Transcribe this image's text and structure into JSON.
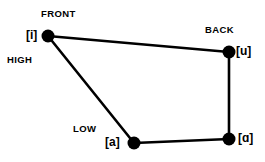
{
  "diagram": {
    "background_color": "#ffffff",
    "stroke_color": "#000000",
    "axis_labels": {
      "front": "FRONT",
      "back": "BACK",
      "high": "HIGH",
      "low": "LOW"
    },
    "vertices": [
      {
        "key": "i",
        "label": "[i]",
        "x": 48,
        "y": 36,
        "dot_radius": 6.5,
        "label_side": "left"
      },
      {
        "key": "u",
        "label": "[u]",
        "x": 229,
        "y": 52,
        "dot_radius": 6.5,
        "label_side": "right"
      },
      {
        "key": "script_a",
        "label": "[ɑ]",
        "x": 229,
        "y": 139,
        "dot_radius": 6.5,
        "label_side": "right"
      },
      {
        "key": "a",
        "label": "[a]",
        "x": 134,
        "y": 143,
        "dot_radius": 6.5,
        "label_side": "left"
      }
    ],
    "edges": [
      {
        "from": "i",
        "to": "u"
      },
      {
        "from": "u",
        "to": "script_a"
      },
      {
        "from": "script_a",
        "to": "a"
      },
      {
        "from": "a",
        "to": "i"
      }
    ]
  }
}
